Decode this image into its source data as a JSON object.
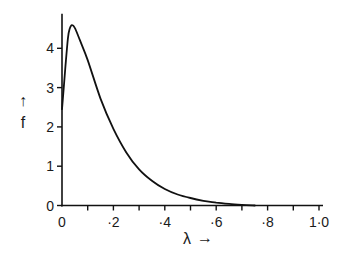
{
  "chart_data": {
    "type": "line",
    "title": "",
    "xlabel": "λ",
    "ylabel": "f",
    "xlabel_arrow": "→",
    "ylabel_arrow": "↑",
    "xlim": [
      0,
      1.0
    ],
    "ylim": [
      0,
      4.88
    ],
    "grid": false,
    "legend": null,
    "x_ticks": [
      0,
      0.1,
      0.2,
      0.3,
      0.4,
      0.5,
      0.6,
      0.7,
      0.8,
      0.9,
      1.0
    ],
    "x_tick_labels": [
      {
        "value": 0,
        "label": "0"
      },
      {
        "value": 0.2,
        "label": "·2"
      },
      {
        "value": 0.4,
        "label": "·4"
      },
      {
        "value": 0.6,
        "label": "·6"
      },
      {
        "value": 0.8,
        "label": "·8"
      },
      {
        "value": 1.0,
        "label": "1·0"
      }
    ],
    "y_ticks": [
      0,
      1,
      2,
      3,
      4
    ],
    "y_tick_labels": [
      "0",
      "1",
      "2",
      "3",
      "4"
    ],
    "series": [
      {
        "name": "f(λ)",
        "color": "#111111",
        "x": [
          0,
          0.013,
          0.023,
          0.03,
          0.039,
          0.05,
          0.07,
          0.1,
          0.15,
          0.2,
          0.25,
          0.3,
          0.35,
          0.4,
          0.45,
          0.5,
          0.55,
          0.6,
          0.65,
          0.7,
          0.75
        ],
        "y": [
          2.45,
          3.5,
          4.25,
          4.5,
          4.59,
          4.52,
          4.2,
          3.7,
          2.72,
          1.95,
          1.35,
          0.92,
          0.63,
          0.42,
          0.28,
          0.19,
          0.12,
          0.075,
          0.04,
          0.015,
          0.0
        ]
      }
    ]
  }
}
